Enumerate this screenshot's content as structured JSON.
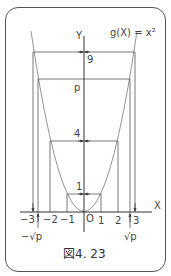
{
  "figure": {
    "function_label": "g(X) = x²",
    "y_axis_label": "Y",
    "x_axis_label": "X",
    "origin_label": "O",
    "caption": "図4. 23"
  },
  "y_ticks": [
    {
      "label": "9",
      "value": 9
    },
    {
      "label": "p",
      "value": 7.5
    },
    {
      "label": "4",
      "value": 4
    },
    {
      "label": "1",
      "value": 1
    }
  ],
  "x_ticks": [
    {
      "label": "−3",
      "value": -3
    },
    {
      "label": "−2",
      "value": -2
    },
    {
      "label": "−1",
      "value": -1
    },
    {
      "label": "1",
      "value": 1
    },
    {
      "label": "2",
      "value": 2
    },
    {
      "label": "3",
      "value": 3
    }
  ],
  "x_special": {
    "neg_sqrt_p": "−√p",
    "pos_sqrt_p": "√p"
  },
  "colors": {
    "axis": "#444444",
    "curve": "#888888",
    "guide": "#666666",
    "frame": "#555555"
  }
}
